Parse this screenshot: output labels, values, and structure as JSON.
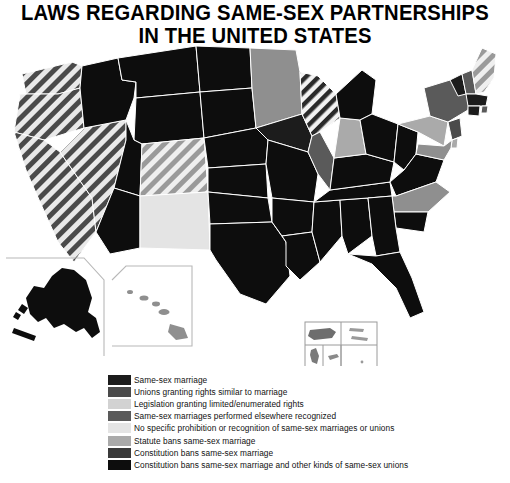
{
  "title": {
    "line1": "LAWS REGARDING SAME-SEX PARTNERSHIPS",
    "line2": "IN THE UNITED STATES"
  },
  "legend": {
    "items": [
      {
        "label": "Same-sex marriage",
        "color": "#1c1c1c",
        "pattern": "solid"
      },
      {
        "label": "Unions granting rights similar to marriage",
        "color": "#4a4a4a",
        "pattern": "solid"
      },
      {
        "label": "Legislation granting limited/enumerated rights",
        "color": "#d2d2d2",
        "pattern": "solid"
      },
      {
        "label": "Same-sex marriages performed elsewhere recognized",
        "color": "#5a5a5a",
        "pattern": "solid"
      },
      {
        "label": "No specific prohibition or recognition of same-sex marriages or unions",
        "color": "#e4e4e4",
        "pattern": "solid"
      },
      {
        "label": "Statute bans same-sex marriage",
        "color": "#aaaaaa",
        "pattern": "solid"
      },
      {
        "label": "Constitution bans same-sex marriage",
        "color": "#3a3a3a",
        "pattern": "solid"
      },
      {
        "label": "Constitution bans same-sex marriage and other kinds of same-sex unions",
        "color": "#0d0d0d",
        "pattern": "solid"
      }
    ]
  },
  "map": {
    "projection_note": "contiguous United States with Alaska, Hawaii and territory insets",
    "insets": {
      "alaska": "Alaska",
      "hawaii": "Hawaii",
      "territories": "territory inset grid"
    },
    "states": [
      {
        "code": "WA",
        "fill": "#4a4a4a",
        "pattern": "hatch"
      },
      {
        "code": "OR",
        "fill": "#4a4a4a",
        "pattern": "hatch"
      },
      {
        "code": "CA",
        "fill": "#4a4a4a",
        "pattern": "hatch"
      },
      {
        "code": "NV",
        "fill": "#4a4a4a",
        "pattern": "hatch"
      },
      {
        "code": "ID",
        "fill": "#0d0d0d",
        "pattern": "solid"
      },
      {
        "code": "MT",
        "fill": "#0d0d0d",
        "pattern": "solid"
      },
      {
        "code": "WY",
        "fill": "#0d0d0d",
        "pattern": "solid"
      },
      {
        "code": "UT",
        "fill": "#0d0d0d",
        "pattern": "solid"
      },
      {
        "code": "AZ",
        "fill": "#0d0d0d",
        "pattern": "solid"
      },
      {
        "code": "CO",
        "fill": "#aaaaaa",
        "pattern": "hatch"
      },
      {
        "code": "NM",
        "fill": "#e4e4e4",
        "pattern": "solid"
      },
      {
        "code": "ND",
        "fill": "#0d0d0d",
        "pattern": "solid"
      },
      {
        "code": "SD",
        "fill": "#0d0d0d",
        "pattern": "solid"
      },
      {
        "code": "NE",
        "fill": "#0d0d0d",
        "pattern": "solid"
      },
      {
        "code": "KS",
        "fill": "#0d0d0d",
        "pattern": "solid"
      },
      {
        "code": "OK",
        "fill": "#0d0d0d",
        "pattern": "solid"
      },
      {
        "code": "TX",
        "fill": "#0d0d0d",
        "pattern": "solid"
      },
      {
        "code": "MN",
        "fill": "#8f8f8f",
        "pattern": "solid"
      },
      {
        "code": "IA",
        "fill": "#1c1c1c",
        "pattern": "solid"
      },
      {
        "code": "MO",
        "fill": "#0d0d0d",
        "pattern": "solid"
      },
      {
        "code": "AR",
        "fill": "#0d0d0d",
        "pattern": "solid"
      },
      {
        "code": "LA",
        "fill": "#0d0d0d",
        "pattern": "solid"
      },
      {
        "code": "WI",
        "fill": "#8f8f8f",
        "pattern": "hatch"
      },
      {
        "code": "IL",
        "fill": "#5a5a5a",
        "pattern": "solid"
      },
      {
        "code": "MS",
        "fill": "#0d0d0d",
        "pattern": "solid"
      },
      {
        "code": "AL",
        "fill": "#0d0d0d",
        "pattern": "solid"
      },
      {
        "code": "TN",
        "fill": "#0d0d0d",
        "pattern": "solid"
      },
      {
        "code": "KY",
        "fill": "#0d0d0d",
        "pattern": "solid"
      },
      {
        "code": "IN",
        "fill": "#aaaaaa",
        "pattern": "solid"
      },
      {
        "code": "MI",
        "fill": "#0d0d0d",
        "pattern": "solid"
      },
      {
        "code": "OH",
        "fill": "#0d0d0d",
        "pattern": "solid"
      },
      {
        "code": "WV",
        "fill": "#0d0d0d",
        "pattern": "solid"
      },
      {
        "code": "VA",
        "fill": "#0d0d0d",
        "pattern": "solid"
      },
      {
        "code": "NC",
        "fill": "#8f8f8f",
        "pattern": "solid"
      },
      {
        "code": "SC",
        "fill": "#0d0d0d",
        "pattern": "solid"
      },
      {
        "code": "GA",
        "fill": "#0d0d0d",
        "pattern": "solid"
      },
      {
        "code": "FL",
        "fill": "#0d0d0d",
        "pattern": "solid"
      },
      {
        "code": "PA",
        "fill": "#aaaaaa",
        "pattern": "solid"
      },
      {
        "code": "NY",
        "fill": "#5a5a5a",
        "pattern": "solid"
      },
      {
        "code": "VT",
        "fill": "#1c1c1c",
        "pattern": "solid"
      },
      {
        "code": "NH",
        "fill": "#5a5a5a",
        "pattern": "solid"
      },
      {
        "code": "ME",
        "fill": "#aaaaaa",
        "pattern": "hatch"
      },
      {
        "code": "MA",
        "fill": "#1c1c1c",
        "pattern": "solid"
      },
      {
        "code": "RI",
        "fill": "#5a5a5a",
        "pattern": "solid"
      },
      {
        "code": "CT",
        "fill": "#1c1c1c",
        "pattern": "solid"
      },
      {
        "code": "NJ",
        "fill": "#4a4a4a",
        "pattern": "solid"
      },
      {
        "code": "DE",
        "fill": "#aaaaaa",
        "pattern": "solid"
      },
      {
        "code": "MD",
        "fill": "#8f8f8f",
        "pattern": "solid"
      },
      {
        "code": "AK",
        "fill": "#0d0d0d",
        "pattern": "solid"
      },
      {
        "code": "HI",
        "fill": "#8f8f8f",
        "pattern": "solid"
      }
    ]
  }
}
